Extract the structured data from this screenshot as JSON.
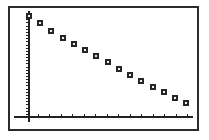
{
  "chart_data": {
    "type": "scatter",
    "title": "",
    "subtitle": "",
    "xlabel": "",
    "ylabel": "",
    "x": [
      0,
      1,
      2,
      3,
      4,
      5,
      6,
      7,
      8,
      9,
      10,
      11,
      12,
      13,
      14
    ],
    "values": [
      100,
      93,
      85,
      78,
      72,
      66,
      60,
      54,
      48,
      42,
      36,
      30,
      25,
      19,
      14
    ],
    "series": [
      {
        "name": "",
        "values": [
          100,
          93,
          85,
          78,
          72,
          66,
          60,
          54,
          48,
          42,
          36,
          30,
          25,
          19,
          14
        ]
      }
    ],
    "xlim": [
      0,
      14.6
    ],
    "ylim": [
      0,
      104
    ],
    "grid": false,
    "legend": false,
    "legend_position": "none",
    "xtick_count": 14,
    "ytick_count": 34,
    "xtick_labels": [],
    "ytick_labels": [],
    "annotations": [],
    "marker": "open-square",
    "marker_color": "#262626",
    "frame_color": "#2b2b2b",
    "background_color": "#ffffff"
  },
  "figure": {
    "frame_label": "plot-border",
    "axis_x_label": "horizontal-axis",
    "axis_y_label": "vertical-axis"
  }
}
